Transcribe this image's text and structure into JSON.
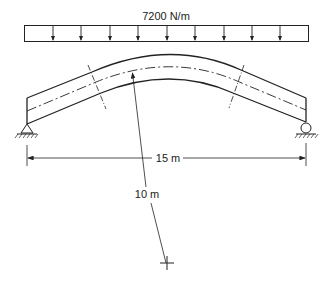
{
  "diagram": {
    "load_label": "7200 N/m",
    "span_label": "15 m",
    "radius_label": "10 m",
    "load_arrow_count": 9,
    "elements": {
      "distributed_load": "uniform downward load",
      "beam": "curved beam with straight end segments",
      "left_support": "pin support",
      "right_support": "roller support",
      "radius_center": "center of curvature"
    },
    "colors": {
      "line": "#222222",
      "background": "#ffffff"
    }
  }
}
